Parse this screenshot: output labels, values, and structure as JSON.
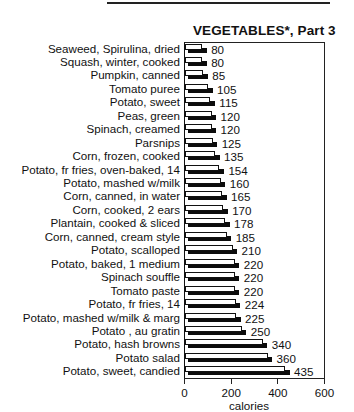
{
  "header": {
    "clipped_text": "(...)"
  },
  "chart_data": {
    "type": "bar",
    "orientation": "horizontal",
    "title": "VEGETABLES*, Part 3",
    "xlabel": "calories",
    "ylabel": "",
    "xlim": [
      0,
      600
    ],
    "xticks": [
      "0",
      "200",
      "400",
      "600"
    ],
    "grid": false,
    "legend": null,
    "categories": [
      "Seaweed, Spirulina, dried",
      "Squash, winter, cooked",
      "Pumpkin, canned",
      "Tomato puree",
      "Potato, sweet",
      "Peas, green",
      "Spinach, creamed",
      "Parsnips",
      "Corn, frozen, cooked",
      "Potato, fr fries, oven-baked, 14",
      "Potato, mashed w/milk",
      "Corn, canned, in water",
      "Corn, cooked, 2 ears",
      "Plantain, cooked & sliced",
      "Corn, canned, cream style",
      "Potato, scalloped",
      "Potato, baked, 1 medium",
      "Spinach souffle",
      "Tomato paste",
      "Potato, fr fries, 14",
      "Potato, mashed w/milk & marg",
      "Potato , au gratin",
      "Potato, hash browns",
      "Potato salad",
      "Potato, sweet, candied"
    ],
    "values": [
      80,
      80,
      85,
      105,
      115,
      120,
      120,
      125,
      135,
      154,
      160,
      165,
      170,
      178,
      185,
      210,
      220,
      220,
      220,
      224,
      225,
      250,
      340,
      360,
      435
    ],
    "value_labels": [
      "80",
      "80",
      "85",
      "105",
      "115",
      "120",
      "120",
      "125",
      "135",
      "154",
      "160",
      "165",
      "170",
      "178",
      "185",
      "210",
      "220",
      "220",
      "220",
      "224",
      "225",
      "250",
      "340",
      "360",
      "435"
    ],
    "bar_style": {
      "face": "#ffffff",
      "outline": "#111111",
      "shadow": "#0c0c0c"
    }
  }
}
